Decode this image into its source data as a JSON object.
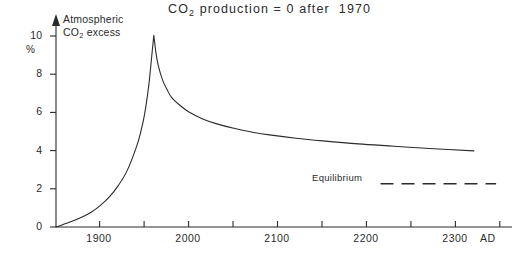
{
  "chart_data": {
    "type": "line",
    "title": "CO2 production = 0 after 1970",
    "title_parts": {
      "prefix": "CO",
      "sub": "2",
      "suffix": " production = 0 after  1970"
    },
    "ylabel_parts": {
      "line1": "Atmospheric",
      "line2_prefix": "CO",
      "line2_sub": "2",
      "line2_suffix": " excess"
    },
    "ylabel": "Atmospheric CO2 excess",
    "yunit": "%",
    "xlabel": "AD",
    "xlim": [
      1860,
      2365
    ],
    "ylim": [
      0,
      10.8
    ],
    "yticks": [
      0,
      2,
      4,
      6,
      8,
      10
    ],
    "ytick_labels": [
      "0",
      "2",
      "4",
      "6",
      "8",
      "10"
    ],
    "xticks": [
      1900,
      1950,
      2000,
      2050,
      2100,
      2150,
      2200,
      2250,
      2300,
      2350
    ],
    "xtick_labels_major": [
      "1900",
      "2000",
      "2100",
      "2200",
      "2300"
    ],
    "xticks_major": [
      1900,
      2000,
      2100,
      2200,
      2300
    ],
    "grid": false,
    "legend_position": "inside-lower-right",
    "series": [
      {
        "name": "Atmospheric CO2 excess",
        "style": "solid",
        "x": [
          1860,
          1875,
          1890,
          1900,
          1910,
          1920,
          1930,
          1940,
          1950,
          1955,
          1960,
          1965,
          1970,
          1972,
          1975,
          1980,
          1985,
          1990,
          2000,
          2010,
          2025,
          2040,
          2060,
          2080,
          2100,
          2130,
          2160,
          2200,
          2240,
          2280,
          2330
        ],
        "y": [
          0.0,
          0.25,
          0.55,
          0.8,
          1.15,
          1.6,
          2.2,
          3.0,
          4.2,
          5.0,
          6.1,
          7.8,
          10.2,
          9.4,
          8.6,
          7.8,
          7.3,
          6.9,
          6.45,
          6.1,
          5.75,
          5.5,
          5.25,
          5.05,
          4.9,
          4.72,
          4.58,
          4.42,
          4.3,
          4.18,
          4.05
        ]
      },
      {
        "name": "Equilibrium",
        "style": "dashed",
        "label": "Equilibrium",
        "y_value": 2.3,
        "x_start": 2225,
        "x_end": 2355
      }
    ],
    "annotations": [
      {
        "text": "Equilibrium",
        "x": 2200,
        "y": 2.4
      }
    ],
    "colors": {
      "axis": "#2b2b2b",
      "curve": "#2b2b2b",
      "equilibrium": "#2b2b2b",
      "background": "#ffffff"
    }
  },
  "geometry": {
    "plot_left": 56,
    "plot_right": 505,
    "plot_bottom": 227,
    "plot_top": 24,
    "y_axis_arrow_top": 17,
    "x_axis_end": 512,
    "equilibrium_line_y": 182,
    "equilibrium_x_start": 386,
    "equilibrium_x_end": 502
  }
}
